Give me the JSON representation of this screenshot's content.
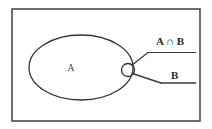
{
  "figure": {
    "background_color": "#ffffff",
    "stroke_color": "#3a3a3a",
    "text_color": "#2a2a2a",
    "frame": {
      "name": "outer-border-rectangle",
      "x": 12,
      "y": 9,
      "width": 188,
      "height": 112,
      "stroke_width": 1.6
    },
    "shapes": {
      "set_a_ellipse": {
        "label": "A",
        "cx": 81,
        "cy": 67.5,
        "rx": 52,
        "ry": 32.5,
        "stroke_width": 1.3
      },
      "intersection_circle": {
        "label": "A ∩ B",
        "cx": 128,
        "cy": 70,
        "r": 6.5,
        "stroke_width": 1.3
      }
    },
    "labels": {
      "set_a": "A",
      "intersection": "A ∩ B",
      "set_b": "B"
    },
    "label_positions": {
      "set_a": {
        "x": 71,
        "y": 71
      },
      "intersection": {
        "x": 156,
        "y": 45
      },
      "set_b": {
        "x": 171,
        "y": 79
      }
    },
    "leaders": {
      "intersection_leader": {
        "from_x": 132,
        "from_y": 66,
        "elbow_x": 148,
        "elbow_y": 52.5,
        "to_x": 196,
        "to_y": 52.5
      },
      "set_b_leader": {
        "from_x": 133,
        "from_y": 74,
        "elbow_x": 161,
        "elbow_y": 83,
        "to_x": 196,
        "to_y": 83
      }
    }
  }
}
